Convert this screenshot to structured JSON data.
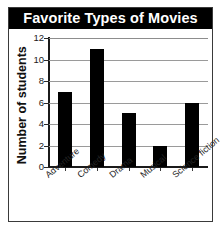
{
  "chart_data": {
    "type": "bar",
    "title": "Favorite Types of Movies",
    "xlabel": "",
    "ylabel": "Number of students",
    "categories": [
      "Adventure",
      "Comedy",
      "Drama",
      "Musical",
      "Science fiction"
    ],
    "values": [
      7,
      11,
      5,
      2,
      6
    ],
    "ylim": [
      0,
      12
    ],
    "ytick_labels": [
      "0",
      "2",
      "4",
      "6",
      "8",
      "10",
      "12"
    ],
    "ytick_values": [
      0,
      2,
      4,
      6,
      8,
      10,
      12
    ],
    "grid": "horizontal",
    "legend": "none",
    "bar_color": "#000000",
    "grid_color": "#9a9a9a",
    "title_background": "#000000",
    "title_color": "#ffffff"
  }
}
